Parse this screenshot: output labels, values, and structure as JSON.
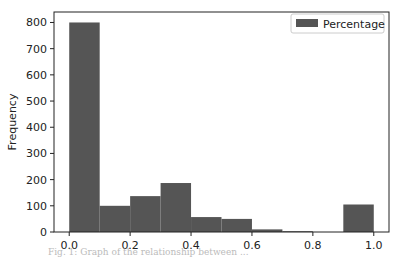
{
  "chart_data": {
    "type": "bar",
    "subtype": "histogram",
    "title": "",
    "xlabel": "",
    "ylabel": "Frequency",
    "bin_edges": [
      0.0,
      0.1,
      0.2,
      0.3,
      0.4,
      0.5,
      0.6,
      0.7,
      0.8,
      0.9,
      1.0
    ],
    "categories": [
      "0.0-0.1",
      "0.1-0.2",
      "0.2-0.3",
      "0.3-0.4",
      "0.4-0.5",
      "0.5-0.6",
      "0.6-0.7",
      "0.7-0.8",
      "0.8-0.9",
      "0.9-1.0"
    ],
    "series": [
      {
        "name": "Percentage",
        "values": [
          800,
          100,
          137,
          187,
          57,
          50,
          10,
          3,
          0,
          105
        ],
        "color": "#555555"
      }
    ],
    "xlim": [
      -0.05,
      1.05
    ],
    "ylim": [
      0,
      840
    ],
    "xticks": [
      0.0,
      0.2,
      0.4,
      0.6,
      0.8,
      1.0
    ],
    "xtick_labels": [
      "0.0",
      "0.2",
      "0.4",
      "0.6",
      "0.8",
      "1.0"
    ],
    "yticks": [
      0,
      100,
      200,
      300,
      400,
      500,
      600,
      700,
      800
    ],
    "ytick_labels": [
      "0",
      "100",
      "200",
      "300",
      "400",
      "500",
      "600",
      "700",
      "800"
    ],
    "grid": false,
    "legend": {
      "position": "upper right",
      "entries": [
        "Percentage"
      ]
    }
  },
  "caption": "Fig. 1: Graph of the relationship between ..."
}
